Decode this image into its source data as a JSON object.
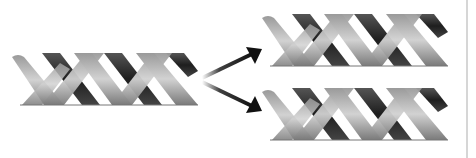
{
  "diagram": {
    "caption": "One DNA double helix replicates into two identical double helices",
    "nodes": [
      {
        "id": "parent",
        "label": "Parent DNA double helix",
        "turns": 3
      },
      {
        "id": "daughter-top",
        "label": "Daughter DNA double helix (top)",
        "turns": 3
      },
      {
        "id": "daughter-bottom",
        "label": "Daughter DNA double helix (bottom)",
        "turns": 3
      }
    ],
    "edges": [
      {
        "from": "parent",
        "to": "daughter-top",
        "icon": "arrow-up-right-icon"
      },
      {
        "from": "parent",
        "to": "daughter-bottom",
        "icon": "arrow-down-right-icon"
      }
    ],
    "colors": {
      "strand_light": "#b8b8b8",
      "strand_mid": "#8a8a8a",
      "strand_dark": "#2e2e2e",
      "arrow": "#111111",
      "background": "#ffffff",
      "frame": "#d6d6d6"
    }
  }
}
